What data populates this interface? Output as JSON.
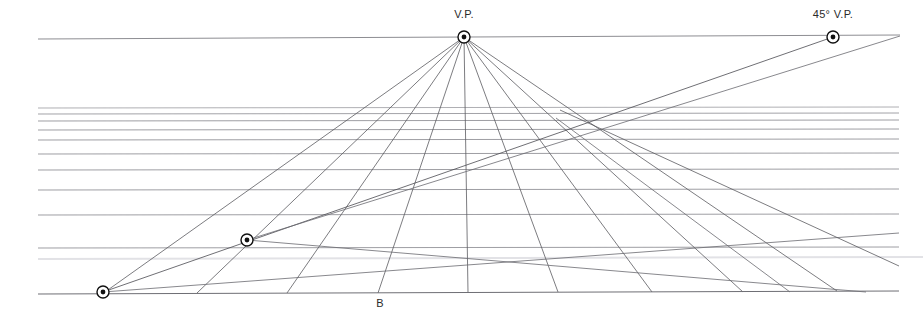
{
  "document": {
    "title": "One-Point Perspective Grid with 45-Degree Vanishing Point",
    "background_color": "#ffffff",
    "width": 923,
    "height": 331
  },
  "labels": {
    "vanishing_point": "V.P.",
    "diagonal_vanishing_point": "45° V.P.",
    "base_point": "B"
  },
  "colors": {
    "horizon_line": "#8d8d92",
    "orthogonal_line": "#5a5a60",
    "horizontal_line": "#7b7b82",
    "faint_line": "#d8d8dc",
    "diagonal_line": "#4a4a50",
    "marker_stroke": "#111111",
    "marker_fill": "#111111",
    "label_text": "#2b2b2b",
    "baseline": "#6e6e74"
  },
  "chart_data": {
    "type": "diagram",
    "canvas": {
      "width": 923,
      "height": 331
    },
    "points": [
      {
        "name": "vanishing-point",
        "label": "V.P.",
        "x": 464,
        "y": 37,
        "marker": "circled-dot",
        "radius": 6,
        "label_x": 464,
        "label_y": 18,
        "label_anchor": "middle"
      },
      {
        "name": "diagonal-vanishing-point",
        "label": "45° V.P.",
        "x": 833,
        "y": 37,
        "marker": "circled-dot",
        "radius": 6,
        "label_x": 833,
        "label_y": 18,
        "label_anchor": "middle"
      },
      {
        "name": "measuring-point-left",
        "label": "",
        "x": 247,
        "y": 240,
        "marker": "circled-dot",
        "radius": 6,
        "label_x": 247,
        "label_y": 228,
        "label_anchor": "middle"
      },
      {
        "name": "baseline-origin-point",
        "label": "",
        "x": 103,
        "y": 292,
        "marker": "circled-dot",
        "radius": 6,
        "label_x": 103,
        "label_y": 280,
        "label_anchor": "middle"
      },
      {
        "name": "base-point-b",
        "label": "B",
        "x": 378,
        "y": 293,
        "marker": "none",
        "radius": 0,
        "label_x": 380,
        "label_y": 307,
        "label_anchor": "middle"
      }
    ],
    "horizon_line": {
      "x1": 38,
      "y1": 39,
      "x2": 900,
      "y2": 35,
      "color": "#8d8d92",
      "width": 1
    },
    "baseline": {
      "x1": 38,
      "y1": 294,
      "x2": 899,
      "y2": 291,
      "color": "#6e6e74",
      "width": 1
    },
    "orthogonals": {
      "apex_x": 464,
      "apex_y": 37,
      "note": "Lines radiating from the vanishing point down to the ground baseline",
      "baseline_x": [
        105,
        197,
        287,
        378,
        468,
        558,
        652,
        743,
        837
      ],
      "baseline_y": [
        292,
        293,
        293,
        293,
        293,
        292,
        292,
        292,
        291
      ],
      "color": "#5a5a60",
      "width": 0.8
    },
    "transversals": {
      "note": "Horizontal receding lines, spacing increases toward the viewer",
      "x_left": 38,
      "x_right": 899,
      "y_values": [
        108,
        114,
        121,
        130,
        140,
        154,
        170,
        190,
        215,
        248
      ],
      "colors": [
        "#9a9aa0",
        "#8a8a90",
        "#85858b",
        "#85858b",
        "#85858b",
        "#85858b",
        "#85858b",
        "#85858b",
        "#85858b",
        "#85858b"
      ],
      "width": 0.8
    },
    "faint_band": {
      "x1": 38,
      "y1": 259,
      "x2": 923,
      "y2": 257,
      "color": "#e2e2e6",
      "width": 2
    },
    "diagonals": [
      {
        "name": "diagonal-45-main",
        "note": "45-degree line from the 45° V.P. through the grid to the lower-left origin point",
        "x1": 833,
        "y1": 37,
        "x2": 103,
        "y2": 292,
        "color": "#4a4a50",
        "width": 0.8
      },
      {
        "name": "diagonal-45-secondary",
        "note": "Second diagonal converging at the left measuring point",
        "x1": 247,
        "y1": 240,
        "x2": 900,
        "y2": 36,
        "color": "#6a6a70",
        "width": 0.8
      },
      {
        "name": "diagonal-descending-right-a",
        "note": "Diagonal from upper-left region descending to lower right",
        "x1": 103,
        "y1": 292,
        "x2": 899,
        "y2": 233,
        "color": "#6a6a70",
        "width": 0.8
      },
      {
        "name": "diagonal-descending-right-b",
        "x1": 247,
        "y1": 240,
        "x2": 866,
        "y2": 292,
        "color": "#6a6a70",
        "width": 0.8
      },
      {
        "name": "diagonal-descending-right-c",
        "x1": 560,
        "y1": 110,
        "x2": 899,
        "y2": 266,
        "color": "#5a5a60",
        "width": 0.8
      },
      {
        "name": "diagonal-descending-right-d",
        "x1": 556,
        "y1": 118,
        "x2": 790,
        "y2": 292,
        "color": "#6a6a70",
        "width": 0.8
      }
    ]
  }
}
